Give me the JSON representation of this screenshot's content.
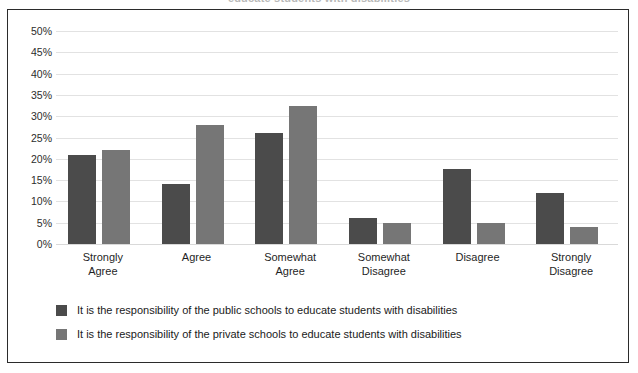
{
  "chart_data": {
    "type": "bar",
    "title": "educate students with disabilities",
    "xlabel": "",
    "ylabel": "",
    "ylim": [
      0,
      50
    ],
    "ytick_labels": [
      "50%",
      "45%",
      "40%",
      "35%",
      "30%",
      "25%",
      "20%",
      "15%",
      "10%",
      "5%",
      "0%"
    ],
    "ytick_values": [
      50,
      45,
      40,
      35,
      30,
      25,
      20,
      15,
      10,
      5,
      0
    ],
    "grid": true,
    "legend_position": "bottom-left",
    "categories": [
      "Strongly Agree",
      "Agree",
      "Somewhat Agree",
      "Somewhat Disagree",
      "Disagree",
      "Strongly Disagree"
    ],
    "category_lines": [
      [
        "Strongly",
        "Agree"
      ],
      [
        "Agree",
        ""
      ],
      [
        "Somewhat",
        "Agree"
      ],
      [
        "Somewhat",
        "Disagree"
      ],
      [
        "Disagree",
        ""
      ],
      [
        "Strongly",
        "Disagree"
      ]
    ],
    "series": [
      {
        "name": "It is the responsibility of the public schools to educate students with disabilities",
        "color": "#4b4b4b",
        "values": [
          21,
          14,
          26,
          6,
          17.5,
          12
        ]
      },
      {
        "name": "It is the responsibility of the private schools to educate students with disabilities",
        "color": "#767676",
        "values": [
          22,
          28,
          32.5,
          5,
          5,
          4
        ]
      }
    ]
  },
  "colors": {
    "series_public": "#4b4b4b",
    "series_private": "#767676",
    "gridline": "#e2e2e2",
    "frame_border": "#2b2b2b",
    "text": "#1a1a1a",
    "background": "#ffffff"
  }
}
